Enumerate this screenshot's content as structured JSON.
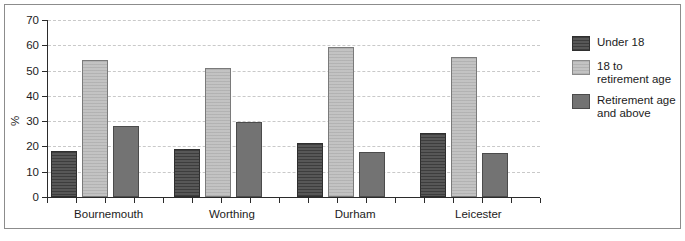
{
  "chart_data": {
    "type": "bar",
    "title": "",
    "xlabel": "",
    "ylabel": "%",
    "ylim": [
      0,
      70
    ],
    "yticks": [
      0,
      10,
      20,
      30,
      40,
      50,
      60,
      70
    ],
    "grid": true,
    "legend_position": "right",
    "categories": [
      "Bournemouth",
      "Worthing",
      "Durham",
      "Leicester"
    ],
    "series": [
      {
        "name": "Under 18",
        "color": "#4e4e4e",
        "values": [
          18.2,
          19.0,
          21.5,
          25.5
        ]
      },
      {
        "name": "18 to retirement age",
        "color": "#bcbcbc",
        "values": [
          54.0,
          51.0,
          59.5,
          55.5
        ]
      },
      {
        "name": "Retirement age and above",
        "color": "#737373",
        "values": [
          28.2,
          29.7,
          18.0,
          17.5
        ]
      }
    ]
  },
  "legend": {
    "items": [
      {
        "label": "Under 18"
      },
      {
        "label": "18 to retirement age"
      },
      {
        "label": "Retirement age and above"
      }
    ]
  }
}
